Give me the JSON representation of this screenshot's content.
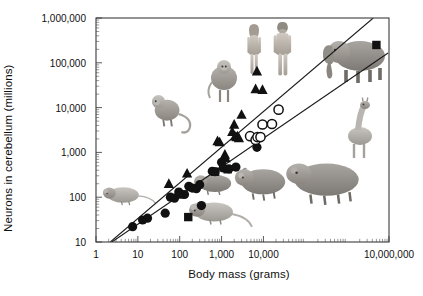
{
  "chart_data": {
    "type": "scatter",
    "title": "",
    "xlabel": "Body mass (grams)",
    "ylabel": "Neurons in cerebellum (millions)",
    "xscale": "log",
    "yscale": "log",
    "xlim": [
      1,
      10000000
    ],
    "ylim": [
      10,
      1000000
    ],
    "grid": false,
    "legend_position": "none",
    "xticks": [
      {
        "value": 1,
        "label": "1"
      },
      {
        "value": 10,
        "label": "10"
      },
      {
        "value": 100,
        "label": "100"
      },
      {
        "value": 1000,
        "label": "1,000"
      },
      {
        "value": 10000,
        "label": "10,000"
      },
      {
        "value": 10000000,
        "label": "10,000,000"
      }
    ],
    "yticks": [
      {
        "value": 10,
        "label": "10"
      },
      {
        "value": 100,
        "label": "100"
      },
      {
        "value": 1000,
        "label": "1,000"
      },
      {
        "value": 10000,
        "label": "10,000"
      },
      {
        "value": 100000,
        "label": "100,000"
      },
      {
        "value": 1000000,
        "label": "1,000,000"
      }
    ],
    "series": [
      {
        "name": "Glires (filled circles)",
        "marker": "filled-circle",
        "points": [
          [
            7.5,
            22
          ],
          [
            13,
            31
          ],
          [
            17,
            34
          ],
          [
            45,
            44
          ],
          [
            60,
            100
          ],
          [
            75,
            95
          ],
          [
            95,
            130
          ],
          [
            130,
            115
          ],
          [
            165,
            175
          ],
          [
            200,
            160
          ],
          [
            250,
            155
          ],
          [
            300,
            190
          ],
          [
            330,
            65
          ],
          [
            600,
            380
          ],
          [
            700,
            370
          ],
          [
            1000,
            600
          ],
          [
            1100,
            450
          ],
          [
            1500,
            430
          ],
          [
            2200,
            470
          ],
          [
            7000,
            1300
          ]
        ]
      },
      {
        "name": "Primates (filled triangles)",
        "marker": "triangle",
        "points": [
          [
            55,
            200
          ],
          [
            150,
            340
          ],
          [
            800,
            1800
          ],
          [
            900,
            1700
          ],
          [
            1200,
            900
          ],
          [
            1250,
            750
          ],
          [
            1800,
            2900
          ],
          [
            2000,
            4200
          ],
          [
            2100,
            2300
          ],
          [
            2300,
            2200
          ],
          [
            2400,
            2300
          ],
          [
            2600,
            2100
          ],
          [
            3000,
            7000
          ],
          [
            6500,
            26000
          ],
          [
            7000,
            65000
          ],
          [
            9500,
            25000
          ]
        ]
      },
      {
        "name": "Artiodactyls (open circles)",
        "marker": "open-circle",
        "points": [
          [
            4800,
            2300
          ],
          [
            6500,
            1900
          ],
          [
            7200,
            2200
          ],
          [
            8500,
            2200
          ],
          [
            9500,
            4200
          ],
          [
            16000,
            4300
          ],
          [
            23000,
            9000
          ]
        ]
      },
      {
        "name": "Afrotherians (filled squares)",
        "marker": "square",
        "points": [
          [
            100,
            115
          ],
          [
            160,
            36
          ],
          [
            700,
            370
          ],
          [
            1400,
            420
          ],
          [
            5000000,
            250000
          ]
        ]
      }
    ],
    "regression_lines": [
      {
        "name": "upper-fit",
        "start": [
          2.2,
          10
        ],
        "end": [
          4200000,
          1000000
        ]
      },
      {
        "name": "lower-fit",
        "start": [
          2.4,
          10
        ],
        "end": [
          9500000,
          165000
        ]
      }
    ],
    "annotations": [
      {
        "name": "mouse-illustration",
        "label": "mouse"
      },
      {
        "name": "rat-illustration",
        "label": "rat"
      },
      {
        "name": "guinea-pig-illustration",
        "label": "guinea pig"
      },
      {
        "name": "agouti-illustration",
        "label": "agouti"
      },
      {
        "name": "capybara-illustration",
        "label": "capybara"
      },
      {
        "name": "small-monkey-illustration",
        "label": "monkey"
      },
      {
        "name": "large-monkey-illustration",
        "label": "macaque"
      },
      {
        "name": "human-female-illustration",
        "label": "human female"
      },
      {
        "name": "human-male-illustration",
        "label": "human male"
      },
      {
        "name": "elephant-illustration",
        "label": "elephant"
      },
      {
        "name": "giraffe-illustration",
        "label": "giraffe"
      }
    ]
  }
}
